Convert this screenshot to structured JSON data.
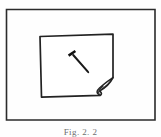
{
  "figure": {
    "caption": "Fig. 2. 2",
    "background_color": "#fefefe",
    "ink_color": "#1a1a1a",
    "frame": {
      "name": "outer-border",
      "x": 6,
      "y": 9,
      "width": 149,
      "height": 111,
      "stroke_width": 1.6
    },
    "paper": {
      "name": "paper-sheet",
      "corners": {
        "top_left": [
          40,
          36
        ],
        "top_right": [
          113,
          34
        ],
        "bottom_right": [
          113,
          78
        ],
        "bottom_left": [
          41,
          97
        ]
      },
      "stroke_width": 1.6,
      "curl": {
        "name": "curled-corner",
        "location": "bottom-right",
        "tip": [
          100,
          95
        ],
        "fold_start": [
          113,
          78
        ],
        "fold_end": [
          96,
          92
        ]
      }
    },
    "nail": {
      "name": "nail",
      "head": [
        71,
        53
      ],
      "tip": [
        88,
        72
      ],
      "angle_degrees": 48,
      "stroke_width": 2.2
    }
  }
}
